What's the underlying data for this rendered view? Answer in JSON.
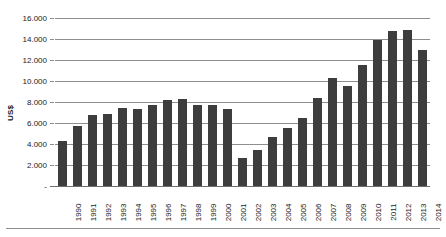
{
  "chart_data": {
    "type": "bar",
    "title": "",
    "subtitle": "",
    "xlabel": "",
    "ylabel": "US$",
    "categories": [
      "1990",
      "1991",
      "1992",
      "1993",
      "1994",
      "1995",
      "1996",
      "1997",
      "1998",
      "1999",
      "2000",
      "2001",
      "2002",
      "2003",
      "2004",
      "2005",
      "2006",
      "2007",
      "2008",
      "2009",
      "2010",
      "2011",
      "2012",
      "2013",
      "2014"
    ],
    "values": [
      4300,
      5700,
      6750,
      6900,
      7450,
      7350,
      7700,
      8150,
      8250,
      7750,
      7700,
      7300,
      2700,
      3400,
      4700,
      5500,
      6500,
      8400,
      10300,
      9500,
      11500,
      13900,
      14800,
      14900,
      13000
    ],
    "ylim": [
      0,
      16000
    ],
    "yticks": [
      0,
      2000,
      4000,
      6000,
      8000,
      10000,
      12000,
      14000,
      16000
    ],
    "ytick_labels": [
      "-",
      "2.000",
      "4.000",
      "6.000",
      "8.000",
      "10.000",
      "12.000",
      "14.000",
      "16.000"
    ],
    "grid": true,
    "legend": false,
    "legend_position": "none",
    "series_color": "#3d3d3d",
    "gridline_color": "#8e8e8e",
    "axis_color": "#6e6e6e"
  }
}
